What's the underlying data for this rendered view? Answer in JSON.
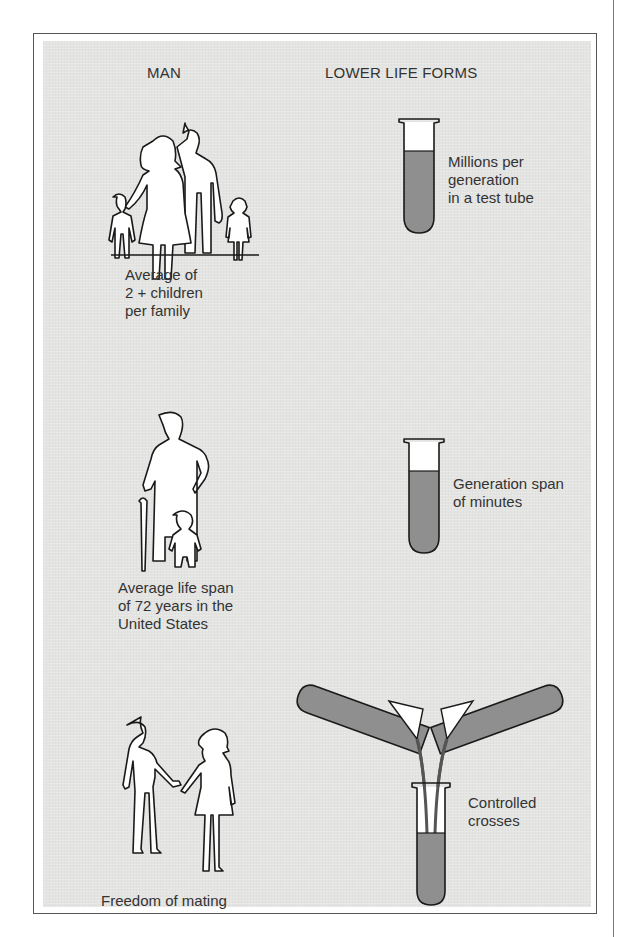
{
  "columns": {
    "left_header": "MAN",
    "right_header": "LOWER LIFE FORMS"
  },
  "rows": [
    {
      "man_icon": "family-icon",
      "man_caption": "Average of\n2 + children\nper family",
      "lower_icon": "test-tube-icon",
      "lower_caption": "Millions per\ngeneration\nin a test tube"
    },
    {
      "man_icon": "elderly-man-with-child-icon",
      "man_caption": "Average life span\nof 72 years in the\nUnited States",
      "lower_icon": "test-tube-icon",
      "lower_caption": "Generation span\nof  minutes"
    },
    {
      "man_icon": "couple-holding-hands-icon",
      "man_caption": "Freedom of mating",
      "lower_icon": "pouring-test-tubes-icon",
      "lower_caption": "Controlled\ncrosses"
    }
  ],
  "colors": {
    "panel_fill": "#e4e4e2",
    "liquid": "#8f8f8f",
    "outline": "#1a1a1a",
    "figure_fill": "#ffffff",
    "border": "#555555"
  }
}
